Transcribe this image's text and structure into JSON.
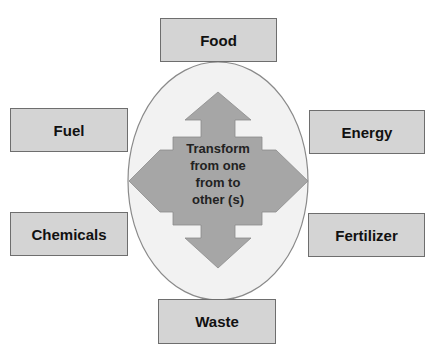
{
  "diagram": {
    "center": {
      "label_lines": [
        "Transform",
        "from one",
        "from to",
        "other (s)"
      ],
      "shape": "four-way-arrow-in-ellipse"
    },
    "nodes": [
      {
        "id": "food",
        "label": "Food",
        "position": "top"
      },
      {
        "id": "fuel",
        "label": "Fuel",
        "position": "upper-left"
      },
      {
        "id": "energy",
        "label": "Energy",
        "position": "upper-right"
      },
      {
        "id": "chemicals",
        "label": "Chemicals",
        "position": "lower-left"
      },
      {
        "id": "fertilizer",
        "label": "Fertilizer",
        "position": "lower-right"
      },
      {
        "id": "waste",
        "label": "Waste",
        "position": "bottom"
      }
    ],
    "colors": {
      "box_fill": "#d4d4d4",
      "box_border": "#6e6e6e",
      "ellipse_fill": "#f2f2f2",
      "ellipse_border": "#8a8a8a",
      "arrow_fill": "#a6a6a6"
    }
  }
}
